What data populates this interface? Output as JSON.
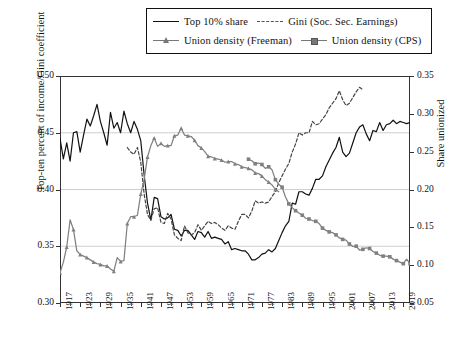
{
  "chart_data": {
    "type": "line",
    "title": "",
    "xlabel": "",
    "ylabel": "Top-ten percent of income/Gini coefficient",
    "ylabel_right": "Share unionized",
    "xlim": [
      1917,
      2021
    ],
    "ylim": [
      0.3,
      0.5
    ],
    "ylim_right": [
      0.05,
      0.35
    ],
    "grid": true,
    "legend_position": "top-center",
    "xticks": [
      1917,
      1923,
      1929,
      1935,
      1941,
      1947,
      1953,
      1959,
      1965,
      1971,
      1977,
      1983,
      1989,
      1995,
      2001,
      2007,
      2013,
      2019
    ],
    "yticks_left": [
      "0.30",
      "0.35",
      "0.40",
      "0.45",
      "0.50"
    ],
    "yticks_right": [
      "0.05",
      "0.10",
      "0.15",
      "0.20",
      "0.25",
      "0.30",
      "0.35"
    ],
    "series": [
      {
        "name": "Top 10% share",
        "axis": "left",
        "style": "solid",
        "color": "#111111",
        "marker": "none",
        "x": [
          1917,
          1918,
          1919,
          1920,
          1921,
          1922,
          1923,
          1924,
          1925,
          1926,
          1927,
          1928,
          1929,
          1930,
          1931,
          1932,
          1933,
          1934,
          1935,
          1936,
          1937,
          1938,
          1939,
          1940,
          1941,
          1942,
          1943,
          1944,
          1945,
          1946,
          1947,
          1948,
          1949,
          1950,
          1951,
          1952,
          1953,
          1954,
          1955,
          1956,
          1957,
          1958,
          1959,
          1960,
          1961,
          1962,
          1963,
          1964,
          1965,
          1966,
          1967,
          1968,
          1969,
          1970,
          1971,
          1972,
          1973,
          1974,
          1975,
          1976,
          1977,
          1978,
          1979,
          1980,
          1981,
          1982,
          1983,
          1984,
          1985,
          1986,
          1987,
          1988,
          1989,
          1990,
          1991,
          1992,
          1993,
          1994,
          1995,
          1996,
          1997,
          1998,
          1999,
          2000,
          2001,
          2002,
          2003,
          2004,
          2005,
          2006,
          2007,
          2008,
          2009,
          2010,
          2011,
          2012,
          2013,
          2014,
          2015,
          2016,
          2017,
          2018,
          2019,
          2020,
          2021
        ],
        "y": [
          0.445,
          0.427,
          0.441,
          0.425,
          0.45,
          0.451,
          0.433,
          0.448,
          0.462,
          0.456,
          0.465,
          0.475,
          0.46,
          0.45,
          0.439,
          0.468,
          0.454,
          0.459,
          0.45,
          0.469,
          0.458,
          0.45,
          0.46,
          0.453,
          0.443,
          0.413,
          0.388,
          0.373,
          0.393,
          0.392,
          0.376,
          0.374,
          0.375,
          0.378,
          0.365,
          0.364,
          0.359,
          0.364,
          0.364,
          0.36,
          0.356,
          0.363,
          0.362,
          0.358,
          0.363,
          0.357,
          0.358,
          0.357,
          0.356,
          0.352,
          0.354,
          0.347,
          0.348,
          0.347,
          0.346,
          0.346,
          0.343,
          0.338,
          0.338,
          0.34,
          0.343,
          0.344,
          0.347,
          0.345,
          0.348,
          0.355,
          0.362,
          0.368,
          0.372,
          0.388,
          0.387,
          0.398,
          0.398,
          0.396,
          0.395,
          0.401,
          0.409,
          0.409,
          0.412,
          0.42,
          0.426,
          0.432,
          0.437,
          0.446,
          0.433,
          0.429,
          0.432,
          0.441,
          0.45,
          0.455,
          0.457,
          0.449,
          0.443,
          0.452,
          0.451,
          0.459,
          0.452,
          0.457,
          0.458,
          0.461,
          0.458,
          0.46,
          0.459,
          0.458,
          0.459
        ]
      },
      {
        "name": "Gini (Soc. Sec. Earnings)",
        "axis": "left",
        "style": "dashed",
        "color": "#444444",
        "marker": "none",
        "x": [
          1937,
          1938,
          1939,
          1940,
          1941,
          1942,
          1943,
          1944,
          1945,
          1946,
          1947,
          1948,
          1949,
          1950,
          1951,
          1952,
          1953,
          1954,
          1955,
          1956,
          1957,
          1958,
          1959,
          1960,
          1961,
          1962,
          1963,
          1964,
          1965,
          1966,
          1967,
          1968,
          1969,
          1970,
          1971,
          1972,
          1973,
          1974,
          1975,
          1976,
          1977,
          1978,
          1979,
          1980,
          1981,
          1982,
          1983,
          1984,
          1985,
          1986,
          1987,
          1988,
          1989,
          1990,
          1991,
          1992,
          1993,
          1994,
          1995,
          1996,
          1997,
          1998,
          1999,
          2000,
          2001,
          2002,
          2003,
          2004,
          2005,
          2006,
          2007
        ],
        "y": [
          0.437,
          0.433,
          0.431,
          0.437,
          0.424,
          0.396,
          0.378,
          0.373,
          0.383,
          0.384,
          0.371,
          0.37,
          0.379,
          0.374,
          0.36,
          0.357,
          0.355,
          0.368,
          0.362,
          0.36,
          0.362,
          0.369,
          0.364,
          0.368,
          0.372,
          0.37,
          0.371,
          0.369,
          0.366,
          0.364,
          0.368,
          0.366,
          0.365,
          0.372,
          0.378,
          0.378,
          0.375,
          0.381,
          0.39,
          0.388,
          0.389,
          0.388,
          0.389,
          0.394,
          0.398,
          0.406,
          0.412,
          0.418,
          0.423,
          0.433,
          0.44,
          0.45,
          0.448,
          0.45,
          0.45,
          0.46,
          0.457,
          0.458,
          0.462,
          0.466,
          0.472,
          0.476,
          0.48,
          0.487,
          0.479,
          0.474,
          0.476,
          0.481,
          0.486,
          0.49,
          0.488
        ]
      },
      {
        "name": "Union density (Freeman)",
        "axis": "right",
        "style": "solid",
        "color": "#808080",
        "marker": "triangle",
        "x": [
          1917,
          1918,
          1919,
          1920,
          1921,
          1922,
          1923,
          1924,
          1925,
          1926,
          1927,
          1928,
          1929,
          1930,
          1931,
          1932,
          1933,
          1934,
          1935,
          1936,
          1937,
          1938,
          1939,
          1940,
          1941,
          1942,
          1943,
          1944,
          1945,
          1946,
          1947,
          1948,
          1949,
          1950,
          1951,
          1952,
          1953,
          1954,
          1955,
          1956,
          1957,
          1958,
          1959,
          1960,
          1961,
          1962,
          1963,
          1964,
          1965,
          1966,
          1967,
          1968,
          1969,
          1970,
          1971,
          1972,
          1973,
          1974,
          1975,
          1976,
          1977,
          1978,
          1979,
          1980,
          1981,
          1982
        ],
        "y": [
          0.09,
          0.104,
          0.124,
          0.16,
          0.147,
          0.119,
          0.114,
          0.112,
          0.11,
          0.107,
          0.104,
          0.102,
          0.101,
          0.099,
          0.099,
          0.095,
          0.092,
          0.11,
          0.105,
          0.106,
          0.155,
          0.164,
          0.164,
          0.166,
          0.194,
          0.213,
          0.243,
          0.258,
          0.268,
          0.257,
          0.261,
          0.257,
          0.258,
          0.258,
          0.271,
          0.272,
          0.281,
          0.272,
          0.271,
          0.27,
          0.265,
          0.258,
          0.255,
          0.25,
          0.244,
          0.243,
          0.241,
          0.24,
          0.239,
          0.236,
          0.237,
          0.237,
          0.234,
          0.233,
          0.23,
          0.229,
          0.228,
          0.226,
          0.222,
          0.221,
          0.218,
          0.213,
          0.21,
          0.206,
          0.2,
          0.197
        ]
      },
      {
        "name": "Union density (CPS)",
        "axis": "right",
        "style": "solid",
        "color": "#808080",
        "marker": "square",
        "x": [
          1973,
          1974,
          1975,
          1976,
          1977,
          1978,
          1979,
          1980,
          1981,
          1982,
          1983,
          1984,
          1985,
          1986,
          1987,
          1988,
          1989,
          1990,
          1991,
          1992,
          1993,
          1994,
          1995,
          1996,
          1997,
          1998,
          1999,
          2000,
          2001,
          2002,
          2003,
          2004,
          2005,
          2006,
          2007,
          2008,
          2009,
          2010,
          2011,
          2012,
          2013,
          2014,
          2015,
          2016,
          2017,
          2018,
          2019,
          2020,
          2021
        ],
        "y": [
          0.24,
          0.238,
          0.234,
          0.235,
          0.233,
          0.228,
          0.23,
          0.226,
          0.213,
          0.207,
          0.203,
          0.19,
          0.181,
          0.176,
          0.172,
          0.169,
          0.166,
          0.162,
          0.161,
          0.159,
          0.158,
          0.155,
          0.149,
          0.146,
          0.144,
          0.143,
          0.14,
          0.136,
          0.134,
          0.133,
          0.128,
          0.125,
          0.125,
          0.12,
          0.121,
          0.123,
          0.122,
          0.118,
          0.116,
          0.113,
          0.112,
          0.112,
          0.111,
          0.108,
          0.106,
          0.104,
          0.102,
          0.108,
          0.102
        ]
      }
    ]
  },
  "legend": {
    "items": [
      {
        "label": "Top 10% share",
        "style": "solid",
        "marker": "none",
        "color": "#111111"
      },
      {
        "label": "Gini (Soc. Sec. Earnings)",
        "style": "dashed",
        "marker": "none",
        "color": "#444444"
      },
      {
        "label": "Union density (Freeman)",
        "style": "solid",
        "marker": "triangle",
        "color": "#808080"
      },
      {
        "label": "Union density (CPS)",
        "style": "solid",
        "marker": "square",
        "color": "#808080"
      }
    ]
  },
  "axes": {
    "left_title": "Top-ten percent of income/Gini coefficient",
    "right_title": "Share unionized"
  }
}
